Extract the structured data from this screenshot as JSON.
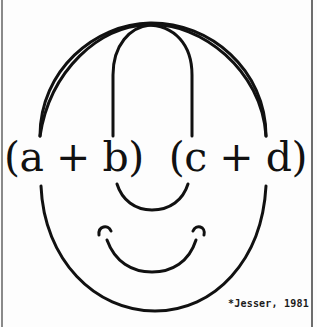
{
  "figure": {
    "expression": "(a + b)  (c + d)",
    "caption": "*Jesser, 1981",
    "colors": {
      "ink": "#111111",
      "background": "#fdfdfd",
      "border": "#7a7a7a"
    }
  }
}
